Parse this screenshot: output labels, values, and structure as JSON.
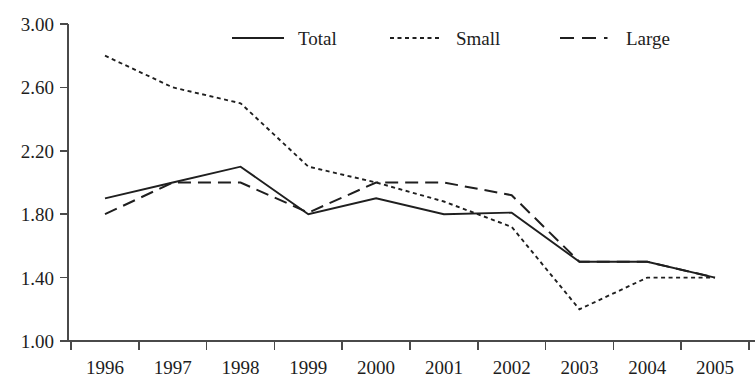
{
  "chart_data": {
    "type": "line",
    "title": "",
    "subtitle": "",
    "xlabel": "",
    "ylabel": "",
    "x": [
      1996,
      1997,
      1998,
      1999,
      2000,
      2001,
      2002,
      2003,
      2004,
      2005
    ],
    "categories": [
      "1996",
      "1997",
      "1998",
      "1999",
      "2000",
      "2001",
      "2002",
      "2003",
      "2004",
      "2005"
    ],
    "xlim": [
      1996,
      2005
    ],
    "ylim": [
      1.0,
      3.0
    ],
    "ytick_values": [
      1.0,
      1.4,
      1.8,
      2.2,
      2.6,
      3.0
    ],
    "ytick_labels": [
      "1.00",
      "1.40",
      "1.80",
      "2.20",
      "2.60",
      "3.00"
    ],
    "xtick_labels": [
      "1996",
      "1997",
      "1998",
      "1999",
      "2000",
      "2001",
      "2002",
      "2003",
      "2004",
      "2005"
    ],
    "grid": false,
    "legend_position": "top-center",
    "series": [
      {
        "name": "Total",
        "style": "solid",
        "color": "#1f1f1f",
        "values": [
          1.9,
          2.0,
          2.1,
          1.8,
          1.9,
          1.8,
          1.81,
          1.5,
          1.5,
          1.4
        ]
      },
      {
        "name": "Small",
        "style": "dotted",
        "color": "#1f1f1f",
        "values": [
          2.8,
          2.6,
          2.5,
          2.1,
          2.0,
          1.88,
          1.72,
          1.2,
          1.4,
          1.4
        ]
      },
      {
        "name": "Large",
        "style": "dashed",
        "color": "#1f1f1f",
        "values": [
          1.8,
          2.0,
          2.0,
          1.81,
          2.0,
          2.0,
          1.92,
          1.5,
          1.5,
          1.4
        ]
      }
    ]
  },
  "legend": {
    "items": [
      {
        "label": "Total",
        "style": "solid"
      },
      {
        "label": "Small",
        "style": "dotted"
      },
      {
        "label": "Large",
        "style": "dashed"
      }
    ]
  },
  "axes": {
    "y_labels": [
      "3.00",
      "2.60",
      "2.20",
      "1.80",
      "1.40",
      "1.00"
    ],
    "x_labels": [
      "1996",
      "1997",
      "1998",
      "1999",
      "2000",
      "2001",
      "2002",
      "2003",
      "2004",
      "2005"
    ]
  }
}
